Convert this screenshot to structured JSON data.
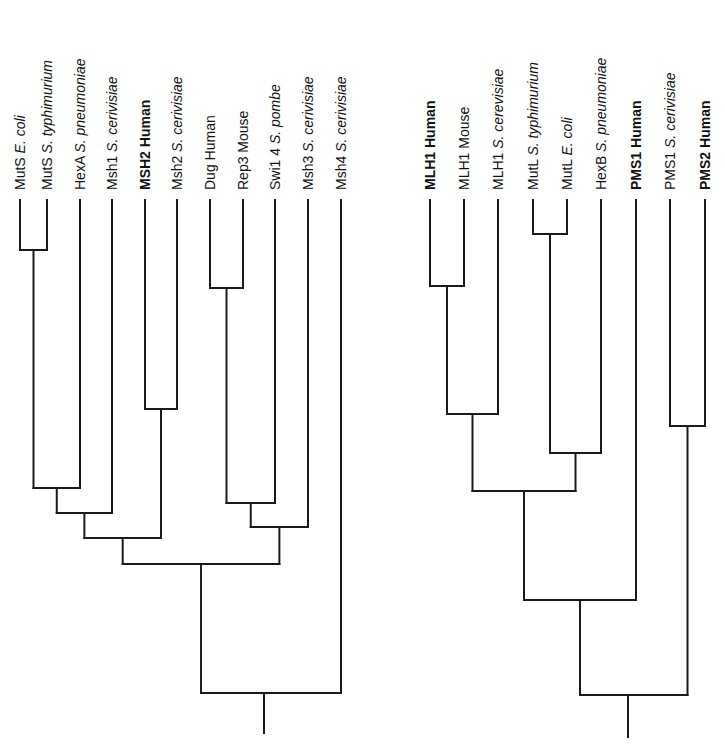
{
  "figure": {
    "left_tree": {
      "name": "MutS homologs",
      "leaves": [
        {
          "x": 20,
          "gene": "MutS",
          "species": "E. coli",
          "species_italic": true,
          "bold": false
        },
        {
          "x": 47,
          "gene": "MutS",
          "species": "S. typhimurium",
          "species_italic": true,
          "bold": false
        },
        {
          "x": 80,
          "gene": "HexA",
          "species": "S. pneumoniae",
          "species_italic": true,
          "bold": false
        },
        {
          "x": 112,
          "gene": "Msh1",
          "species": "S. cerivisiae",
          "species_italic": true,
          "bold": false
        },
        {
          "x": 145,
          "gene": "MSH2",
          "species": "Human",
          "species_italic": false,
          "bold": true
        },
        {
          "x": 177,
          "gene": "Msh2",
          "species": "S. cerivisiae",
          "species_italic": true,
          "bold": false
        },
        {
          "x": 210,
          "gene": "Dug",
          "species": "Human",
          "species_italic": false,
          "bold": false
        },
        {
          "x": 243,
          "gene": "Rep3",
          "species": "Mouse",
          "species_italic": false,
          "bold": false
        },
        {
          "x": 275,
          "gene": "Swi1 4",
          "species": "S. pombe",
          "species_italic": true,
          "bold": false
        },
        {
          "x": 308,
          "gene": "Msh3",
          "species": "S. cerivisiae",
          "species_italic": true,
          "bold": false
        },
        {
          "x": 341,
          "gene": "Msh4",
          "species": "S. cerivisiae",
          "species_italic": true,
          "bold": false
        }
      ],
      "leaf_top_y": 200,
      "nodes": [
        {
          "id": "mutS_pair",
          "y": 250,
          "x1": 20,
          "x2": 47,
          "children": [
            "MutS E. coli",
            "MutS S. typhimurium"
          ]
        },
        {
          "id": "msh2_pair",
          "y": 409,
          "x1": 145,
          "x2": 177,
          "children": [
            "MSH2 Human",
            "Msh2 S. cerivisiae"
          ]
        },
        {
          "id": "dug_rep3",
          "y": 288,
          "x1": 210,
          "x2": 243,
          "children": [
            "Dug Human",
            "Rep3 Mouse"
          ]
        },
        {
          "id": "mutS_hexA",
          "y": 488,
          "x1": 32,
          "x2": 80,
          "children": [
            "mutS_pair",
            "HexA S. pneumoniae"
          ]
        },
        {
          "id": "plus_msh1",
          "y": 513,
          "x1": 55,
          "x2": 112,
          "children": [
            "mutS_hexA",
            "Msh1 S. cerivisiae"
          ]
        },
        {
          "id": "plus_msh2",
          "y": 538,
          "x1": 82,
          "x2": 161,
          "children": [
            "plus_msh1",
            "msh2_pair"
          ]
        },
        {
          "id": "dug_swi",
          "y": 503,
          "x1": 226,
          "x2": 275,
          "children": [
            "dug_rep3",
            "Swi1 4 S. pombe"
          ]
        },
        {
          "id": "plus_msh3",
          "y": 527,
          "x1": 249,
          "x2": 308,
          "children": [
            "dug_swi",
            "Msh3 S. cerivisiae"
          ]
        },
        {
          "id": "big_join",
          "y": 564,
          "x1": 120,
          "x2": 277,
          "children": [
            "plus_msh2",
            "plus_msh3"
          ]
        },
        {
          "id": "root",
          "y": 693,
          "x1": 197,
          "x2": 341,
          "children": [
            "big_join",
            "Msh4 S. cerivisiae"
          ]
        }
      ],
      "root_stem": {
        "x": 264,
        "y1": 693,
        "y2": 733
      }
    },
    "right_tree": {
      "name": "MutL homologs",
      "leaves": [
        {
          "x": 430,
          "gene": "MLH1",
          "species": "Human",
          "species_italic": false,
          "bold": true
        },
        {
          "x": 464,
          "gene": "MLH1",
          "species": "Mouse",
          "species_italic": false,
          "bold": false
        },
        {
          "x": 498,
          "gene": "MLH1",
          "species": "S. cerevisiae",
          "species_italic": true,
          "bold": false
        },
        {
          "x": 533,
          "gene": "MutL",
          "species": "S. typhimurium",
          "species_italic": true,
          "bold": false
        },
        {
          "x": 567,
          "gene": "MutL",
          "species": "E. coli",
          "species_italic": true,
          "bold": false
        },
        {
          "x": 601,
          "gene": "HexB",
          "species": "S. pneumoniae",
          "species_italic": true,
          "bold": false
        },
        {
          "x": 636,
          "gene": "PMS1",
          "species": "Human",
          "species_italic": false,
          "bold": true
        },
        {
          "x": 670,
          "gene": "PMS1",
          "species": "S. cerivisiae",
          "species_italic": true,
          "bold": false
        },
        {
          "x": 705,
          "gene": "PMS2",
          "species": "Human",
          "species_italic": false,
          "bold": true
        }
      ],
      "leaf_top_y": 200,
      "nodes": [
        {
          "id": "mutL_pair",
          "y": 234,
          "x1": 533,
          "x2": 567,
          "children": [
            "MutL S. typhimurium",
            "MutL E. coli"
          ]
        },
        {
          "id": "mlh1_hm",
          "y": 286,
          "x1": 430,
          "x2": 464,
          "children": [
            "MLH1 Human",
            "MLH1 Mouse"
          ]
        },
        {
          "id": "mlh1_all",
          "y": 414,
          "x1": 447,
          "x2": 498,
          "children": [
            "mlh1_hm",
            "MLH1 S. cerevisiae"
          ]
        },
        {
          "id": "pms_pair",
          "y": 426,
          "x1": 670,
          "x2": 705,
          "children": [
            "PMS1 S. cerivisiae",
            "PMS2 Human"
          ]
        },
        {
          "id": "mutL_hexB",
          "y": 453,
          "x1": 550,
          "x2": 601,
          "children": [
            "mutL_pair",
            "HexB S. pneumoniae"
          ]
        },
        {
          "id": "mlh_mut",
          "y": 491,
          "x1": 472,
          "x2": 575,
          "children": [
            "mlh1_all",
            "mutL_hexB"
          ]
        },
        {
          "id": "plus_pms1",
          "y": 600,
          "x1": 523,
          "x2": 634,
          "children": [
            "mlh_mut",
            "PMS1 Human"
          ]
        },
        {
          "id": "root",
          "y": 695,
          "x1": 572,
          "x2": 687,
          "children": [
            "plus_pms1",
            "pms_pair"
          ]
        }
      ],
      "root_stem": {
        "x": 628,
        "y1": 695,
        "y2": 737
      }
    }
  }
}
